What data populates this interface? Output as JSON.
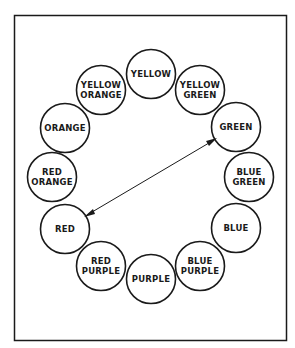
{
  "diagram": {
    "colors": [
      {
        "id": "yellow",
        "lines": [
          "YELLOW"
        ]
      },
      {
        "id": "yellow-green",
        "lines": [
          "YELLOW",
          "GREEN"
        ]
      },
      {
        "id": "green",
        "lines": [
          "GREEN"
        ]
      },
      {
        "id": "blue-green",
        "lines": [
          "BLUE",
          "GREEN"
        ]
      },
      {
        "id": "blue",
        "lines": [
          "BLUE"
        ]
      },
      {
        "id": "blue-purple",
        "lines": [
          "BLUE",
          "PURPLE"
        ]
      },
      {
        "id": "purple",
        "lines": [
          "PURPLE"
        ]
      },
      {
        "id": "red-purple",
        "lines": [
          "RED",
          "PURPLE"
        ]
      },
      {
        "id": "red",
        "lines": [
          "RED"
        ]
      },
      {
        "id": "red-orange",
        "lines": [
          "RED",
          "ORANGE"
        ]
      },
      {
        "id": "orange",
        "lines": [
          "ORANGE"
        ]
      },
      {
        "id": "yellow-orange",
        "lines": [
          "YELLOW",
          "ORANGE"
        ]
      }
    ],
    "arrow": {
      "from": "green",
      "to": "red",
      "bidirectional": true,
      "meaning": "complementary colors"
    },
    "stroke_color": "#1a1a1a",
    "background_color": "#ffffff"
  }
}
